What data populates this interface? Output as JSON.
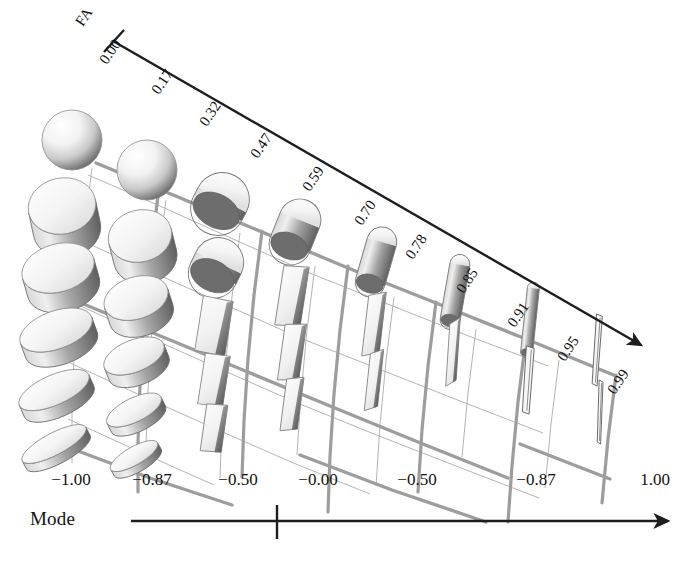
{
  "figure": {
    "type": "diffusion-tensor-glyph-grid",
    "background_color": "#ffffff",
    "ink_color": "#1a1a1a",
    "grid_line_color": "#a8a8a8",
    "glyph_fill_light": "#fbfbfb",
    "glyph_fill_shadow": "#6e6e6e"
  },
  "axes": {
    "fa": {
      "name": "FA",
      "label_rotation_deg": -56,
      "has_arrow": true,
      "has_origin_tick": true,
      "ticks": [
        "0.00",
        "0.17",
        "0.32",
        "0.47",
        "0.59",
        "0.70",
        "0.78",
        "0.85",
        "0.91",
        "0.95",
        "0.99"
      ],
      "tick_positions": [
        {
          "label": "0.00",
          "x": 96,
          "y": 58
        },
        {
          "label": "0.17",
          "x": 148,
          "y": 88
        },
        {
          "label": "0.32",
          "x": 196,
          "y": 120
        },
        {
          "label": "0.47",
          "x": 247,
          "y": 152
        },
        {
          "label": "0.59",
          "x": 299,
          "y": 185
        },
        {
          "label": "0.70",
          "x": 351,
          "y": 219
        },
        {
          "label": "0.78",
          "x": 402,
          "y": 253
        },
        {
          "label": "0.85",
          "x": 453,
          "y": 287
        },
        {
          "label": "0.91",
          "x": 504,
          "y": 321
        },
        {
          "label": "0.95",
          "x": 554,
          "y": 355
        },
        {
          "label": "0.99",
          "x": 604,
          "y": 388
        }
      ]
    },
    "mode": {
      "name": "Mode",
      "has_arrow": true,
      "has_center_tick": true,
      "ticks": [
        "−1.00",
        "−0.87",
        "−0.50",
        "−0.00",
        "−0.50",
        "−0.87",
        "1.00"
      ],
      "tick_positions": [
        {
          "label": "−1.00",
          "x": 71
        },
        {
          "label": "−0.87",
          "x": 152
        },
        {
          "label": "−0.50",
          "x": 238
        },
        {
          "label": "−0.00",
          "x": 318
        },
        {
          "label": "−0.50",
          "x": 417
        },
        {
          "label": "−0.87",
          "x": 536
        },
        {
          "label": "1.00",
          "x": 655
        }
      ]
    }
  },
  "chart_data": {
    "type": "scatter",
    "title": "",
    "xlabel": "Mode",
    "ylabel": "FA",
    "grid": true,
    "legend": "none",
    "mode_categories": [
      "−1.00",
      "−0.87",
      "−0.50",
      "−0.00",
      "−0.50",
      "−0.87",
      "1.00"
    ],
    "fa_categories": [
      "0.00",
      "0.17",
      "0.32",
      "0.47",
      "0.59",
      "0.70",
      "0.78",
      "0.85",
      "0.91",
      "0.95",
      "0.99"
    ],
    "glyphs": [
      {
        "fa": "0.00",
        "mode": "−1.00",
        "cx": 72,
        "cy": 140,
        "rx": 30,
        "ry": 30,
        "shape": "sphere",
        "rot": 0
      },
      {
        "fa": "0.17",
        "mode": "−1.00",
        "cx": 62,
        "cy": 206,
        "rx": 34,
        "ry": 28,
        "shape": "oblate",
        "rot": -12
      },
      {
        "fa": "0.32",
        "mode": "−1.00",
        "cx": 58,
        "cy": 268,
        "rx": 37,
        "ry": 24,
        "shape": "oblate",
        "rot": -16
      },
      {
        "fa": "0.47",
        "mode": "−1.00",
        "cx": 56,
        "cy": 330,
        "rx": 38,
        "ry": 19,
        "shape": "oblate",
        "rot": -20
      },
      {
        "fa": "0.59",
        "mode": "−1.00",
        "cx": 54,
        "cy": 390,
        "rx": 38,
        "ry": 15,
        "shape": "oblate",
        "rot": -24
      },
      {
        "fa": "0.70",
        "mode": "−1.00",
        "cx": 54,
        "cy": 444,
        "rx": 36,
        "ry": 11,
        "shape": "oblate",
        "rot": -28
      },
      {
        "fa": "0.17",
        "mode": "−0.87",
        "cx": 147,
        "cy": 170,
        "rx": 30,
        "ry": 30,
        "shape": "sphere",
        "rot": 0
      },
      {
        "fa": "0.32",
        "mode": "−0.87",
        "cx": 140,
        "cy": 236,
        "rx": 32,
        "ry": 26,
        "shape": "oblate",
        "rot": -14
      },
      {
        "fa": "0.47",
        "mode": "−0.87",
        "cx": 136,
        "cy": 298,
        "rx": 33,
        "ry": 21,
        "shape": "oblate",
        "rot": -18
      },
      {
        "fa": "0.59",
        "mode": "−0.87",
        "cx": 134,
        "cy": 356,
        "rx": 32,
        "ry": 16,
        "shape": "oblate",
        "rot": -22
      },
      {
        "fa": "0.70",
        "mode": "−0.87",
        "cx": 134,
        "cy": 410,
        "rx": 30,
        "ry": 12,
        "shape": "oblate",
        "rot": -26
      },
      {
        "fa": "0.78",
        "mode": "−0.87",
        "cx": 134,
        "cy": 456,
        "rx": 27,
        "ry": 9,
        "shape": "oblate",
        "rot": -30
      },
      {
        "fa": "0.32",
        "mode": "−0.50",
        "cx": 220,
        "cy": 204,
        "rx": 27,
        "ry": 32,
        "shape": "prolate",
        "rot": 28
      },
      {
        "fa": "0.47",
        "mode": "−0.50",
        "cx": 216,
        "cy": 268,
        "rx": 25,
        "ry": 31,
        "shape": "prolate",
        "rot": 26
      },
      {
        "fa": "0.59",
        "mode": "−0.50",
        "cx": 214,
        "cy": 326,
        "rx": 22,
        "ry": 30,
        "shape": "plate",
        "rot": 24
      },
      {
        "fa": "0.70",
        "mode": "−0.50",
        "cx": 214,
        "cy": 380,
        "rx": 18,
        "ry": 28,
        "shape": "plate",
        "rot": 22
      },
      {
        "fa": "0.78",
        "mode": "−0.50",
        "cx": 214,
        "cy": 428,
        "rx": 15,
        "ry": 26,
        "shape": "plate",
        "rot": 20
      },
      {
        "fa": "0.47",
        "mode": "−0.00",
        "cx": 295,
        "cy": 232,
        "rx": 21,
        "ry": 34,
        "shape": "prolate",
        "rot": 22
      },
      {
        "fa": "0.59",
        "mode": "−0.00",
        "cx": 292,
        "cy": 296,
        "rx": 18,
        "ry": 33,
        "shape": "plate",
        "rot": 20
      },
      {
        "fa": "0.70",
        "mode": "−0.00",
        "cx": 292,
        "cy": 352,
        "rx": 15,
        "ry": 31,
        "shape": "plate",
        "rot": 18
      },
      {
        "fa": "0.78",
        "mode": "−0.00",
        "cx": 292,
        "cy": 404,
        "rx": 12,
        "ry": 29,
        "shape": "plate",
        "rot": 16
      },
      {
        "fa": "0.59",
        "mode": "−0.50",
        "cx": 376,
        "cy": 262,
        "rx": 15,
        "ry": 36,
        "shape": "cylinder",
        "rot": 16
      },
      {
        "fa": "0.70",
        "mode": "−0.50",
        "cx": 374,
        "cy": 324,
        "rx": 12,
        "ry": 34,
        "shape": "plate",
        "rot": 14
      },
      {
        "fa": "0.78",
        "mode": "−0.50",
        "cx": 374,
        "cy": 380,
        "rx": 9,
        "ry": 32,
        "shape": "plate",
        "rot": 12
      },
      {
        "fa": "0.70",
        "mode": "−0.87",
        "cx": 455,
        "cy": 292,
        "rx": 10,
        "ry": 38,
        "shape": "cylinder",
        "rot": 10
      },
      {
        "fa": "0.78",
        "mode": "−0.87",
        "cx": 453,
        "cy": 352,
        "rx": 7,
        "ry": 35,
        "shape": "plate",
        "rot": 8
      },
      {
        "fa": "0.85",
        "mode": "1.00",
        "cx": 530,
        "cy": 320,
        "rx": 6,
        "ry": 38,
        "shape": "cylinder",
        "rot": 6
      },
      {
        "fa": "0.91",
        "mode": "1.00",
        "cx": 528,
        "cy": 380,
        "rx": 4,
        "ry": 34,
        "shape": "needle",
        "rot": 4
      },
      {
        "fa": "0.95",
        "mode": "1.00",
        "cx": 597,
        "cy": 350,
        "rx": 3,
        "ry": 36,
        "shape": "needle",
        "rot": 4
      },
      {
        "fa": "0.99",
        "mode": "1.00",
        "cx": 600,
        "cy": 412,
        "rx": 2,
        "ry": 32,
        "shape": "needle",
        "rot": 2
      }
    ]
  }
}
